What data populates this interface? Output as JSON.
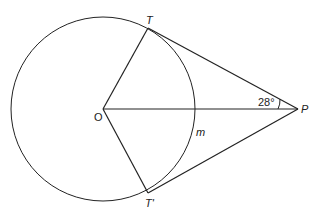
{
  "diagram": {
    "type": "geometry",
    "labels": {
      "center": "O",
      "tangent_point_top": "T",
      "tangent_point_bottom": "T'",
      "external_point": "P",
      "arc_point": "m",
      "angle": "28°"
    },
    "elements": {
      "circle": {
        "cx": 103,
        "cy": 109,
        "r": 92
      },
      "points": {
        "O": [
          103,
          109
        ],
        "T": [
          148,
          28
        ],
        "T_prime": [
          148,
          193
        ],
        "P": [
          298,
          109
        ]
      },
      "segments": [
        "OT",
        "OT'",
        "OP",
        "TP",
        "T'P"
      ],
      "angle_marked": {
        "vertex": "P",
        "between": [
          "TP",
          "OP"
        ],
        "value_deg": 28
      }
    },
    "colors": {
      "stroke": "#222222",
      "background": "#ffffff"
    }
  }
}
